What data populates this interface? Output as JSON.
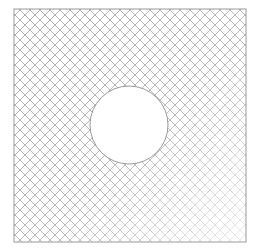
{
  "diagram": {
    "type": "hatched-plate-with-hole",
    "colors": {
      "background": "#ffffff",
      "outline": "#9a9a9a",
      "hatch": "#9a9a9a",
      "hole_fill": "#ffffff"
    },
    "plate": {
      "x": 14,
      "y": 9,
      "width": 232,
      "height": 233
    },
    "hole": {
      "cx": 129,
      "cy": 125,
      "r": 39
    },
    "hatch_spacing": 10
  }
}
